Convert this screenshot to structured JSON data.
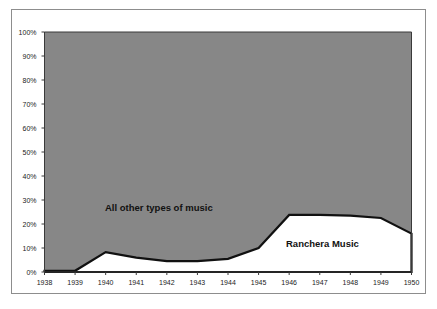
{
  "chart_data": {
    "type": "area",
    "title": "",
    "subtitle": "",
    "xlabel": "",
    "ylabel": "",
    "x": [
      1938,
      1939,
      1940,
      1941,
      1942,
      1943,
      1944,
      1945,
      1946,
      1947,
      1948,
      1949,
      1950
    ],
    "categories": [
      "1938",
      "1939",
      "1940",
      "1941",
      "1942",
      "1943",
      "1944",
      "1945",
      "1946",
      "1947",
      "1948",
      "1949",
      "1950"
    ],
    "xlim": [
      1938,
      1950
    ],
    "ylim": [
      0,
      100
    ],
    "ytick_labels": [
      "0%",
      "10%",
      "20%",
      "30%",
      "40%",
      "50%",
      "60%",
      "70%",
      "80%",
      "90%",
      "100%"
    ],
    "ytick_values": [
      0,
      10,
      20,
      30,
      40,
      50,
      60,
      70,
      80,
      90,
      100
    ],
    "grid": false,
    "legend_position": "inline-annotation",
    "stacked": true,
    "series": [
      {
        "name": "Ranchera Music",
        "color": "#ffffff",
        "values": [
          0.5,
          0.5,
          8.3,
          6.0,
          4.5,
          4.5,
          5.5,
          10.0,
          23.8,
          23.8,
          23.5,
          22.5,
          16.0
        ]
      },
      {
        "name": "All other types of music",
        "color": "#878787",
        "values": [
          99.5,
          99.5,
          91.7,
          94.0,
          95.5,
          95.5,
          94.5,
          90.0,
          76.2,
          76.2,
          76.5,
          77.5,
          84.0
        ]
      }
    ],
    "annotations": [
      {
        "text": "All other types of music",
        "x": 1941.2,
        "y": 28
      },
      {
        "text": "Ranchera Music",
        "x": 1946.9,
        "y": 14
      }
    ],
    "boundary_line_color": "#111111",
    "plot_background": "#878787",
    "figure_background": "#ffffff",
    "frame_color": "#8d8d8d"
  },
  "axes": {
    "y_ticks": [
      {
        "label": "100%",
        "value": 100
      },
      {
        "label": "90%",
        "value": 90
      },
      {
        "label": "80%",
        "value": 80
      },
      {
        "label": "70%",
        "value": 70
      },
      {
        "label": "60%",
        "value": 60
      },
      {
        "label": "50%",
        "value": 50
      },
      {
        "label": "40%",
        "value": 40
      },
      {
        "label": "30%",
        "value": 30
      },
      {
        "label": "20%",
        "value": 20
      },
      {
        "label": "10%",
        "value": 10
      },
      {
        "label": "0%",
        "value": 0
      }
    ],
    "x_ticks": [
      {
        "label": "1938",
        "value": 1938
      },
      {
        "label": "1939",
        "value": 1939
      },
      {
        "label": "1940",
        "value": 1940
      },
      {
        "label": "1941",
        "value": 1941
      },
      {
        "label": "1942",
        "value": 1942
      },
      {
        "label": "1943",
        "value": 1943
      },
      {
        "label": "1944",
        "value": 1944
      },
      {
        "label": "1945",
        "value": 1945
      },
      {
        "label": "1946",
        "value": 1946
      },
      {
        "label": "1947",
        "value": 1947
      },
      {
        "label": "1948",
        "value": 1948
      },
      {
        "label": "1949",
        "value": 1949
      },
      {
        "label": "1950",
        "value": 1950
      }
    ]
  },
  "labels": {
    "all_other": "All other types of music",
    "ranchera": "Ranchera Music"
  }
}
